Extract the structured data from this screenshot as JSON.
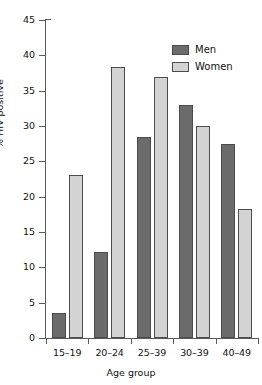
{
  "chart_data": {
    "type": "bar",
    "title": "",
    "xlabel": "Age group",
    "ylabel": "% HIV positive",
    "categories": [
      "15–19",
      "20–24",
      "25–39",
      "30–39",
      "40–49"
    ],
    "series": [
      {
        "name": "Men",
        "color": "#6b6b6b",
        "values": [
          3.5,
          12.2,
          28.5,
          33.0,
          27.5
        ]
      },
      {
        "name": "Women",
        "color": "#d3d3d3",
        "values": [
          23.0,
          38.3,
          37.0,
          30.0,
          18.3
        ]
      }
    ],
    "ylim": [
      0,
      45
    ],
    "yticks": [
      0,
      5,
      10,
      15,
      20,
      25,
      30,
      35,
      40,
      45
    ],
    "ytick_labels": [
      "0",
      "5",
      "10",
      "15",
      "20",
      "25",
      "30",
      "35",
      "40",
      "45"
    ],
    "grid": false,
    "legend_position": "top-right",
    "bar_edge_color": "#4c4c4c",
    "axis_color": "#5a5a5a"
  },
  "legend": {
    "items": [
      {
        "label": "Men"
      },
      {
        "label": "Women"
      }
    ]
  },
  "axes": {
    "x_title": "Age group",
    "y_title": "% HIV positive"
  }
}
